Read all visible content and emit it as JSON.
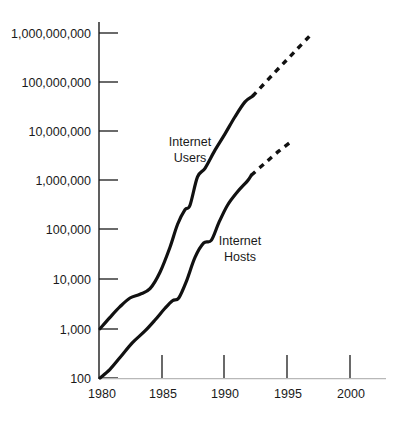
{
  "chart_data": {
    "type": "line",
    "title": "",
    "subtitle": "",
    "xlabel": "",
    "ylabel": "",
    "yscale": "log",
    "ylim": [
      100,
      1000000000
    ],
    "xlim": [
      1979,
      2001
    ],
    "grid": false,
    "legend_position": "inline-annotation",
    "y_tick_labels": [
      "1,000,000,000",
      "100,000,000",
      "10,000,000",
      "1,000,000",
      "100,000",
      "10,000",
      "1,000",
      "100"
    ],
    "y_tick_values": [
      1000000000,
      100000000,
      10000000,
      1000000,
      100000,
      10000,
      1000,
      100
    ],
    "x_tick_labels": [
      "1980",
      "1985",
      "1990",
      "1995",
      "2000"
    ],
    "x_tick_values": [
      1980,
      1985,
      1990,
      1995,
      2000
    ],
    "series": [
      {
        "name": "Internet Users",
        "label": "Internet Users",
        "label_line1": "Internet",
        "label_line2": "Users",
        "style": "solid-then-dashed",
        "solid_points": [
          {
            "x": 1980.0,
            "y": 1000
          },
          {
            "x": 1980.8,
            "y": 1700
          },
          {
            "x": 1981.6,
            "y": 2800
          },
          {
            "x": 1982.4,
            "y": 4200
          },
          {
            "x": 1983.2,
            "y": 5000
          },
          {
            "x": 1984.0,
            "y": 6500
          },
          {
            "x": 1984.8,
            "y": 14000
          },
          {
            "x": 1985.6,
            "y": 45000
          },
          {
            "x": 1986.2,
            "y": 130000
          },
          {
            "x": 1986.8,
            "y": 260000
          },
          {
            "x": 1987.2,
            "y": 320000
          },
          {
            "x": 1987.8,
            "y": 1200000
          },
          {
            "x": 1988.4,
            "y": 1800000
          },
          {
            "x": 1989.2,
            "y": 4200000
          },
          {
            "x": 1990.0,
            "y": 9000000
          },
          {
            "x": 1990.8,
            "y": 20000000
          },
          {
            "x": 1991.6,
            "y": 40000000
          },
          {
            "x": 1992.2,
            "y": 52000000
          }
        ],
        "dashed_points": [
          {
            "x": 1992.2,
            "y": 52000000
          },
          {
            "x": 1994.0,
            "y": 160000000
          },
          {
            "x": 1995.5,
            "y": 400000000
          },
          {
            "x": 1997.0,
            "y": 1000000000
          }
        ]
      },
      {
        "name": "Internet Hosts",
        "label": "Internet Hosts",
        "label_line1": "Internet",
        "label_line2": "Hosts",
        "style": "solid-then-dashed",
        "solid_points": [
          {
            "x": 1980.0,
            "y": 100
          },
          {
            "x": 1980.8,
            "y": 150
          },
          {
            "x": 1981.6,
            "y": 260
          },
          {
            "x": 1982.6,
            "y": 520
          },
          {
            "x": 1983.6,
            "y": 900
          },
          {
            "x": 1984.4,
            "y": 1500
          },
          {
            "x": 1985.2,
            "y": 2600
          },
          {
            "x": 1985.8,
            "y": 3700
          },
          {
            "x": 1986.3,
            "y": 4200
          },
          {
            "x": 1986.9,
            "y": 9000
          },
          {
            "x": 1987.6,
            "y": 28000
          },
          {
            "x": 1988.3,
            "y": 55000
          },
          {
            "x": 1988.9,
            "y": 62000
          },
          {
            "x": 1989.5,
            "y": 140000
          },
          {
            "x": 1990.2,
            "y": 320000
          },
          {
            "x": 1991.0,
            "y": 600000
          },
          {
            "x": 1991.8,
            "y": 1000000
          },
          {
            "x": 1992.1,
            "y": 1300000
          }
        ],
        "dashed_points": [
          {
            "x": 1992.1,
            "y": 1300000
          },
          {
            "x": 1993.2,
            "y": 2300000
          },
          {
            "x": 1994.3,
            "y": 4000000
          },
          {
            "x": 1995.2,
            "y": 6000000
          }
        ]
      }
    ],
    "annotations": [
      {
        "text": "Internet Users",
        "x": 1986.0,
        "y": 5500000
      },
      {
        "text": "Internet Hosts",
        "x": 1989.6,
        "y": 62000
      }
    ]
  }
}
